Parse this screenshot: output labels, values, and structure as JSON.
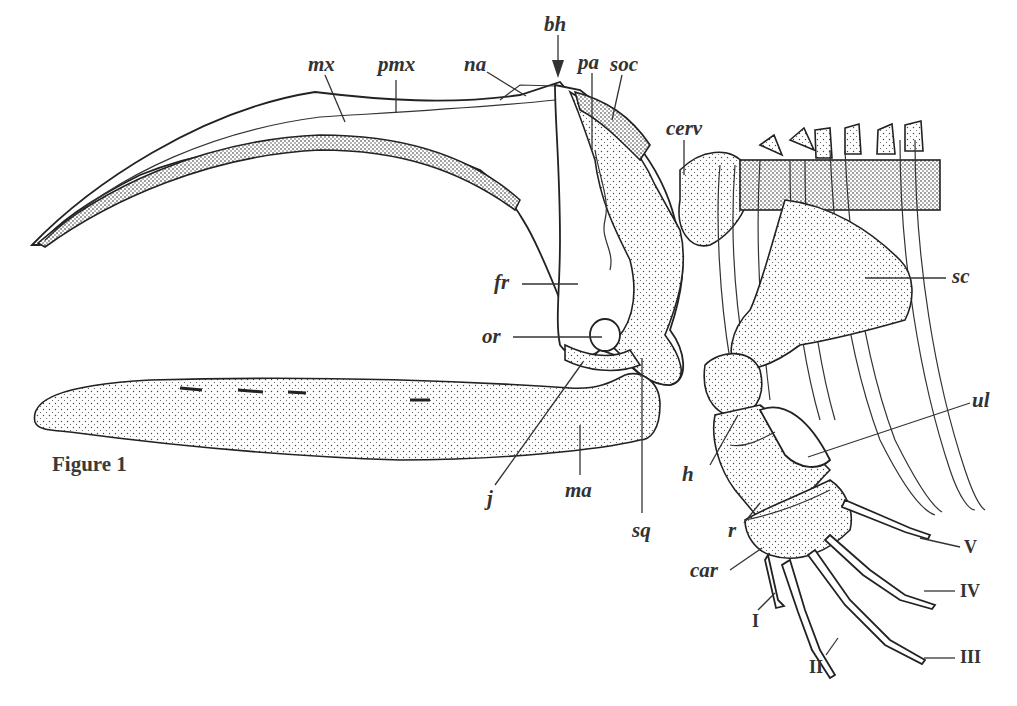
{
  "figure": {
    "caption": "Figure 1"
  },
  "labels": {
    "mx": "mx",
    "pmx": "pmx",
    "na": "na",
    "bh": "bh",
    "pa": "pa",
    "soc": "soc",
    "cerv": "cerv",
    "sc": "sc",
    "fr": "fr",
    "or": "or",
    "j": "j",
    "ma": "ma",
    "sq": "sq",
    "h": "h",
    "ul": "ul",
    "r": "r",
    "car": "car",
    "digit_I": "I",
    "digit_II": "II",
    "digit_III": "III",
    "digit_IV": "IV",
    "digit_V": "V"
  }
}
